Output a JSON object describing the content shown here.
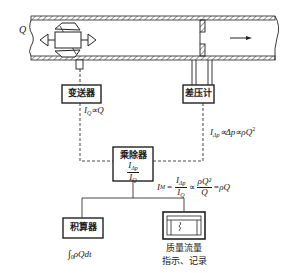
{
  "diagram": {
    "pipe": {
      "flow_label": "Q",
      "flow_direction": "right"
    },
    "nodes": {
      "transmitter": {
        "label": "变送器",
        "output_signal": "I_Q ∝ Q"
      },
      "dp_gauge": {
        "label": "差压计",
        "output_signal": "I_Δp ∝ Δp ∝ ρQ²"
      },
      "multiplier_divider": {
        "label": "乘除器",
        "ratio_num": "I",
        "ratio_num_sub": "Δp",
        "ratio_den": "I",
        "ratio_den_sub": "Q"
      },
      "integrator": {
        "label": "积算器",
        "output": "∫ρQdt"
      },
      "recorder": {
        "label_line1": "质量流量",
        "label_line2": "指示、记录"
      }
    },
    "formula": {
      "lhs": "I",
      "lhs_sub": "M",
      "eq": "=",
      "frac1_num": "I",
      "frac1_num_sub": "Δp",
      "frac1_den": "I",
      "frac1_den_sub": "Q",
      "prop": "∝",
      "frac2_num": "ρQ²",
      "frac2_den": "Q",
      "result": "=ρQ"
    },
    "labels": {
      "iq_prefix": "I",
      "iq_sub": "Q",
      "iq_rest": "∝Q",
      "idp_prefix": "I",
      "idp_sub": "Δp",
      "idp_rest": "∝Δp∝ρQ",
      "idp_sup": "2",
      "integral_sign": "∫",
      "integral_lower": "0",
      "integral_body": "ρQdt"
    }
  }
}
